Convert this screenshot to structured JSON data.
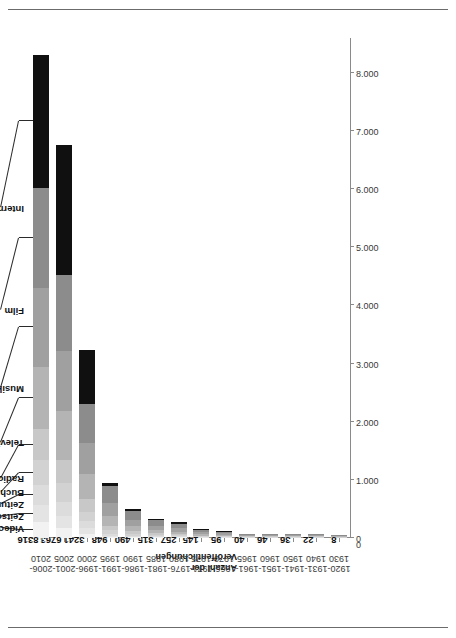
{
  "chart_data": {
    "type": "bar",
    "subtype": "stacked-horizontal",
    "title": "",
    "xlabel": "",
    "ylabel": "Anzahl der\nVeröffentlichungen",
    "ylim": [
      0,
      8600
    ],
    "y_ticks": [
      "0",
      "1.000",
      "2.000",
      "3.000",
      "4.000",
      "5.000",
      "6.000",
      "7.000",
      "8.000"
    ],
    "y_tick_values": [
      0,
      1000,
      2000,
      3000,
      4000,
      5000,
      6000,
      7000,
      8000
    ],
    "grid": false,
    "legend_position": "leader-lines-on-top-bar",
    "categories": [
      "1920-\n1930",
      "1931-\n1940",
      "1941-\n1950",
      "1951-\n1960",
      "1961-\n1965",
      "1966-\n1970",
      "1971-\n1975",
      "1976-\n1980",
      "1981-\n1985",
      "1986-\n1990",
      "1991-\n1995",
      "1996-\n2000",
      "2001-\n2005",
      "2006-\n2010"
    ],
    "totals": [
      8,
      22,
      36,
      46,
      40,
      95,
      145,
      257,
      315,
      490,
      948,
      3241,
      6763,
      8316
    ],
    "total_labels": [
      "8",
      "22",
      "36",
      "46",
      "40",
      "95",
      "145",
      "257",
      "315",
      "490",
      "948",
      "3241",
      "6763",
      "8316"
    ],
    "series": [
      {
        "name": "Videospiele",
        "color": "#f2f2f2",
        "values": [
          0,
          0,
          0,
          0,
          0,
          0,
          0,
          1,
          2,
          4,
          12,
          70,
          180,
          270
        ]
      },
      {
        "name": "Zeitschrift",
        "color": "#e4e4e4",
        "values": [
          0,
          0,
          0,
          0,
          0,
          1,
          2,
          4,
          6,
          10,
          22,
          95,
          210,
          300
        ]
      },
      {
        "name": "Zeitung",
        "color": "#dcdcdc",
        "values": [
          0,
          1,
          1,
          2,
          2,
          3,
          5,
          8,
          12,
          20,
          40,
          120,
          250,
          340
        ]
      },
      {
        "name": "Buch",
        "color": "#d2d2d2",
        "values": [
          1,
          2,
          3,
          4,
          3,
          6,
          9,
          15,
          20,
          32,
          60,
          170,
          330,
          430
        ]
      },
      {
        "name": "Radio",
        "color": "#c8c8c8",
        "values": [
          1,
          3,
          4,
          5,
          4,
          8,
          12,
          20,
          26,
          40,
          78,
          215,
          420,
          530
        ]
      },
      {
        "name": "Television",
        "color": "#b4b4b4",
        "values": [
          2,
          5,
          8,
          10,
          8,
          17,
          26,
          46,
          57,
          88,
          170,
          430,
          860,
          1080
        ]
      },
      {
        "name": "Musik",
        "color": "#a0a0a0",
        "values": [
          2,
          5,
          9,
          11,
          10,
          22,
          33,
          58,
          72,
          110,
          215,
          530,
          1060,
          1350
        ]
      },
      {
        "name": "Film",
        "color": "#8c8c8c",
        "values": [
          2,
          6,
          11,
          14,
          13,
          30,
          45,
          80,
          100,
          156,
          300,
          680,
          1345,
          1716
        ]
      },
      {
        "name": "Internet",
        "color": "#101010",
        "values": [
          0,
          0,
          0,
          0,
          0,
          8,
          13,
          25,
          20,
          30,
          51,
          931,
          2308,
          2300
        ]
      }
    ],
    "legend_labels": [
      "Videospiele",
      "Zeitschrift",
      "Zeitung",
      "Buch",
      "Radio",
      "Television",
      "Musik",
      "Film",
      "Internet"
    ]
  }
}
